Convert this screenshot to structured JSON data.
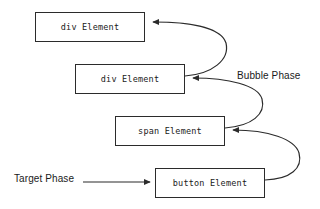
{
  "diagram": {
    "background_color": "#ffffff",
    "stroke_color": "#2b2b2b",
    "nodes": [
      {
        "id": "div-outer",
        "label": "div Element",
        "x": 35,
        "y": 12,
        "width": 110,
        "height": 30
      },
      {
        "id": "div-inner",
        "label": "div Element",
        "x": 75,
        "y": 64,
        "width": 110,
        "height": 30
      },
      {
        "id": "span",
        "label": "span Element",
        "x": 115,
        "y": 116,
        "width": 110,
        "height": 30
      },
      {
        "id": "button",
        "label": "button Element",
        "x": 155,
        "y": 168,
        "width": 110,
        "height": 30
      }
    ],
    "labels": [
      {
        "id": "bubble-phase",
        "text": "Bubble Phase",
        "x": 237,
        "y": 71
      },
      {
        "id": "target-phase",
        "text": "Target Phase",
        "x": 14,
        "y": 174
      }
    ],
    "arrows": [
      {
        "id": "target-to-button",
        "from": "Target Phase label",
        "to": "button Element",
        "kind": "straight"
      },
      {
        "id": "button-to-span",
        "from": "button Element",
        "to": "span Element",
        "kind": "curved"
      },
      {
        "id": "span-to-div-inner",
        "from": "span Element",
        "to": "div Element (inner)",
        "kind": "curved"
      },
      {
        "id": "div-inner-to-div-outer",
        "from": "div Element (inner)",
        "to": "div Element (outer)",
        "kind": "curved"
      }
    ]
  }
}
